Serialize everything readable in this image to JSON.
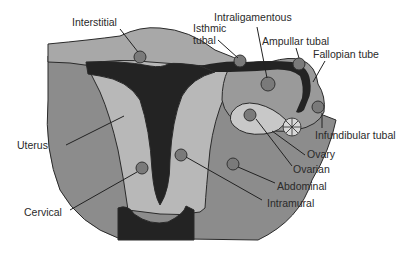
{
  "diagram": {
    "colors": {
      "background": "#ffffff",
      "outer_tissue": "#8c8c8c",
      "uterus_wall": "#b8b8b8",
      "cavity": "#232323",
      "ovary": "#c8c8c8",
      "site_marker": "#7a7a7a",
      "text": "#2a2a2a"
    },
    "labels": {
      "interstitial": "Interstitial",
      "isthmic_1": "Isthmic",
      "isthmic_2": "tubal",
      "intraligamentous": "Intraligamentous",
      "ampullar": "Ampullar tubal",
      "fallopian": "Fallopian tube",
      "infundibular": "Infundibular tubal",
      "ovary": "Ovary",
      "ovarian": "Ovarian",
      "abdominal": "Abdominal",
      "intramural": "Intramural",
      "uterus": "Uterus",
      "cervical": "Cervical"
    }
  }
}
